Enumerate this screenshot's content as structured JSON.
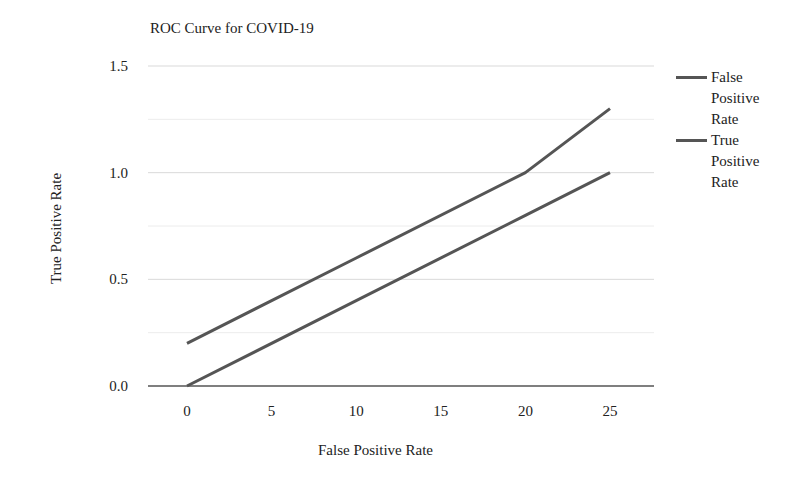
{
  "chart_data": {
    "type": "line",
    "title": "ROC Curve for COVID-19",
    "xlabel": "False Positive Rate",
    "ylabel": "True Positive Rate",
    "x": [
      0,
      10,
      20,
      25
    ],
    "x_ticks": [
      "0",
      "5",
      "10",
      "15",
      "20",
      "25"
    ],
    "y_ticks": [
      "0.0",
      "0.5",
      "1.0",
      "1.5"
    ],
    "ylim": [
      0,
      1.5
    ],
    "xlim": [
      -2.5,
      27.5
    ],
    "grid": true,
    "legend_position": "right",
    "series": [
      {
        "name": "False Positive Rate",
        "values": [
          0.2,
          0.6,
          1.0,
          1.3
        ],
        "color": "#555555"
      },
      {
        "name": "True Positive Rate",
        "values": [
          0.0,
          0.4,
          0.8,
          1.0
        ],
        "color": "#555555"
      }
    ]
  },
  "legend": {
    "items": [
      {
        "label": "False Positive Rate"
      },
      {
        "label": "True Positive Rate"
      }
    ]
  }
}
